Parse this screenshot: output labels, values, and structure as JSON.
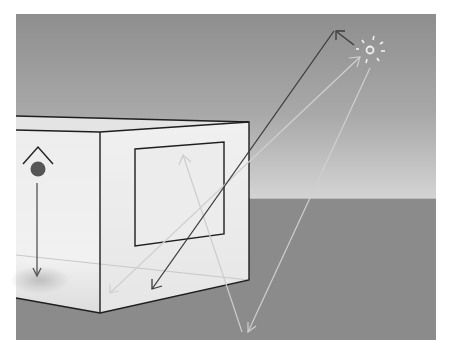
{
  "diagram": {
    "colors": {
      "background": "#ffffff",
      "sky_top": "#8f8f8f",
      "sky_horizon": "#d2d2d2",
      "ground": "#8a8a8a",
      "box_face": "#efefef",
      "box_edge": "#1e1e1e",
      "ray_dark": "#3a3a3a",
      "ray_light": "#cfcfcf",
      "sun": "#f2f2f2",
      "sensor_dot": "#555555"
    },
    "nodes": [
      {
        "id": "sun",
        "label": "",
        "x": 370,
        "y": 50
      },
      {
        "id": "box",
        "label": "",
        "x": 16,
        "y": 116
      },
      {
        "id": "window",
        "label": "",
        "x": 135,
        "y": 142
      },
      {
        "id": "sensor",
        "label": "",
        "x": 38,
        "y": 169
      }
    ],
    "edges": [
      {
        "id": "ray-dark",
        "from": "box-bottom",
        "to": "sky",
        "bidirectional": true
      },
      {
        "id": "ray-light-1",
        "from": "sun",
        "to": "box-bottom-left"
      },
      {
        "id": "ray-light-2",
        "from": "sun",
        "to": "ground"
      },
      {
        "id": "ray-light-3",
        "from": "ground",
        "to": "window"
      },
      {
        "id": "ray-sun-back",
        "from": "sun",
        "to": "sky"
      },
      {
        "id": "sensor-down",
        "from": "sensor",
        "to": "floor"
      }
    ]
  }
}
